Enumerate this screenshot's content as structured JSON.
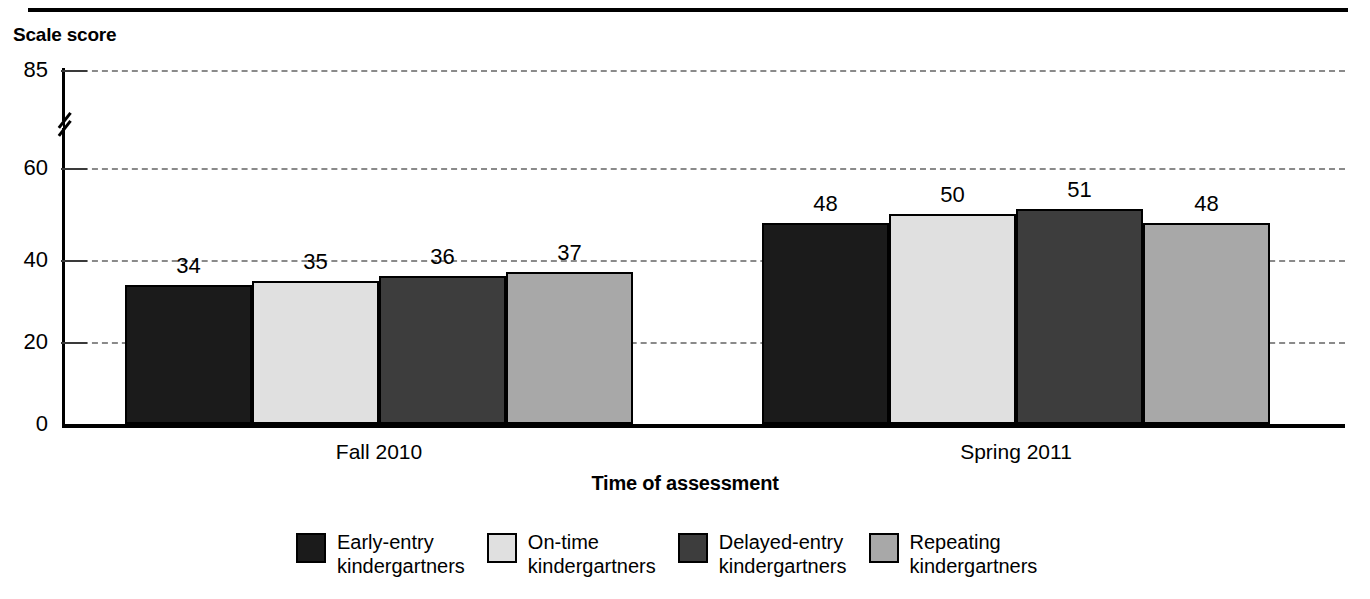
{
  "chart_data": {
    "type": "bar",
    "title": "",
    "ylabel": "Scale score",
    "xlabel": "Time of assessment",
    "categories": [
      "Fall 2010",
      "Spring 2011"
    ],
    "series": [
      {
        "name": "Early-entry kindergartners",
        "values": [
          34,
          48
        ],
        "color": "#1b1b1b",
        "fill_class": "fill-dark"
      },
      {
        "name": "On-time kindergartners",
        "values": [
          35,
          50
        ],
        "color": "#e0e0e0",
        "fill_class": "fill-light"
      },
      {
        "name": "Delayed-entry kindergartners",
        "values": [
          36,
          51
        ],
        "color": "#3d3d3d",
        "fill_class": "fill-mid-dark"
      },
      {
        "name": "Repeating kindergartners",
        "values": [
          37,
          48
        ],
        "color": "#a8a8a8",
        "fill_class": "fill-mid"
      }
    ],
    "yticks": [
      0,
      20,
      40,
      60,
      85
    ],
    "ytick_labels": [
      "0",
      "20",
      "40",
      "60",
      "85"
    ],
    "ylim": [
      0,
      85
    ],
    "axis_break": {
      "between": [
        60,
        85
      ],
      "present": true
    },
    "grid": "horizontal-dashed",
    "legend_position": "bottom"
  },
  "axis": {
    "y_title": "Scale score",
    "x_title": "Time of assessment",
    "y_labels": [
      "85",
      "60",
      "40",
      "20",
      "0"
    ]
  },
  "groups": [
    {
      "label": "Fall 2010",
      "bars": [
        {
          "series": "Early-entry kindergartners",
          "value": 34,
          "value_label": "34"
        },
        {
          "series": "On-time kindergartners",
          "value": 35,
          "value_label": "35"
        },
        {
          "series": "Delayed-entry kindergartners",
          "value": 36,
          "value_label": "36"
        },
        {
          "series": "Repeating kindergartners",
          "value": 37,
          "value_label": "37"
        }
      ]
    },
    {
      "label": "Spring 2011",
      "bars": [
        {
          "series": "Early-entry kindergartners",
          "value": 48,
          "value_label": "48"
        },
        {
          "series": "On-time kindergartners",
          "value": 50,
          "value_label": "50"
        },
        {
          "series": "Delayed-entry kindergartners",
          "value": 51,
          "value_label": "51"
        },
        {
          "series": "Repeating kindergartners",
          "value": 48,
          "value_label": "48"
        }
      ]
    }
  ],
  "legend": {
    "items": [
      {
        "label": "Early-entry\nkindergartners",
        "color": "#1b1b1b"
      },
      {
        "label": "On-time\nkindergartners",
        "color": "#e0e0e0"
      },
      {
        "label": "Delayed-entry\nkindergartners",
        "color": "#3d3d3d"
      },
      {
        "label": "Repeating\nkindergartners",
        "color": "#a8a8a8"
      }
    ]
  }
}
